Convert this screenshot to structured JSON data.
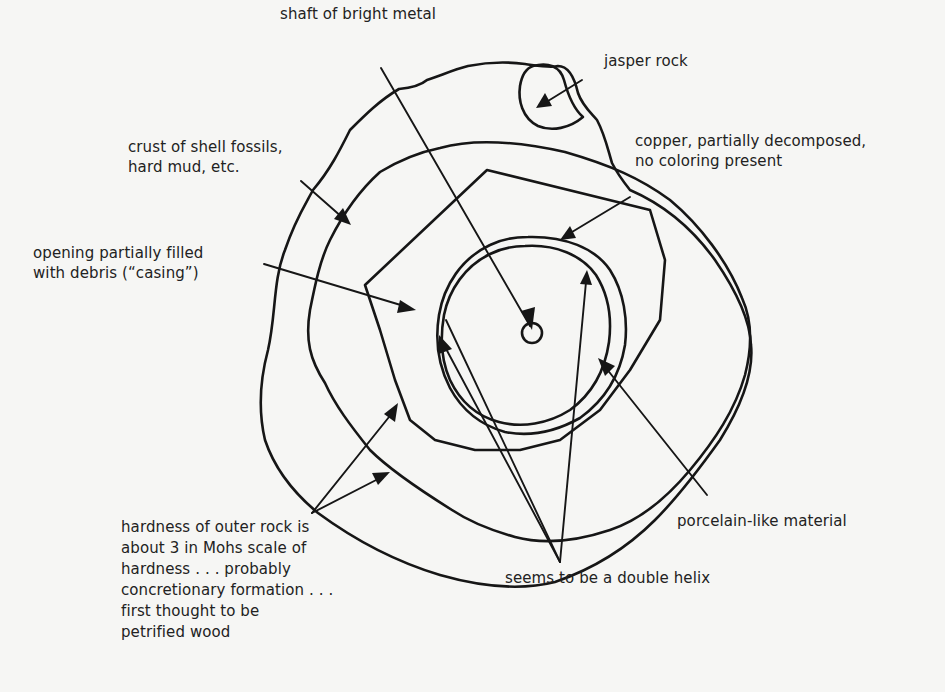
{
  "figure": {
    "type": "annotated cross-section sketch of a rock specimen",
    "background_color": "#f6f6f4",
    "ink_color": "#161616"
  },
  "labels": {
    "shaft": "shaft of bright metal",
    "jasper": "jasper rock",
    "crust": "crust of shell fossils,\nhard mud, etc.",
    "copper": "copper, partially decomposed,\nno coloring present",
    "opening": "opening partially filled\nwith debris (“casing”)",
    "hardness": "hardness of outer rock is\nabout 3 in Mohs scale of\nhardness . . . probably\nconcretionary formation . . .\nfirst thought to be\npetrified wood",
    "porcelain": "porcelain-like material",
    "helix": "seems to be a double helix"
  }
}
